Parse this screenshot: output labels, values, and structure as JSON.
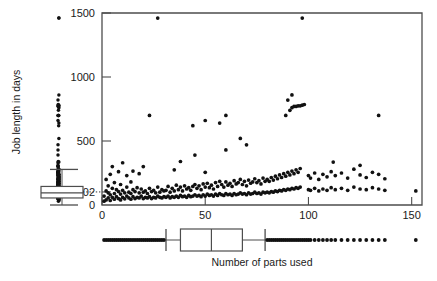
{
  "figure": {
    "background": "#ffffff",
    "point_color": "#111111",
    "line_color": "#4d4d4d",
    "box_fill": "#ffffff",
    "width": 437,
    "height": 281
  },
  "axes": {
    "y": {
      "title": "Job length in days",
      "ticks": [
        0,
        102,
        500,
        1000,
        1500
      ],
      "tick_labels": [
        "0",
        "102",
        "500",
        "1000",
        "1500"
      ],
      "range": [
        0,
        1500
      ],
      "orientation": "vertical-rotated-label"
    },
    "x": {
      "title": "Number of parts used",
      "ticks": [
        0,
        50,
        100,
        150
      ],
      "tick_labels": [
        "0",
        "50",
        "100",
        "150"
      ],
      "range": [
        0,
        155
      ]
    },
    "frame": {
      "left": 102,
      "right": 422,
      "top": 13,
      "bottom": 205
    }
  },
  "marginal": {
    "y_boxplot": {
      "orientation": "vertical",
      "min_whisker": 0,
      "lower_quartile": 55,
      "median": 95,
      "upper_quartile": 145,
      "upper_whisker": 278,
      "outliers": [
        305,
        330,
        355,
        380,
        410,
        440,
        470,
        500,
        540,
        580,
        620,
        650,
        680,
        700,
        715,
        730,
        745,
        760,
        775,
        790,
        805,
        860,
        1460
      ],
      "strip_note": "one-dimensional strip of all y values drawn left of the boxplot"
    },
    "x_boxplot": {
      "orientation": "horizontal",
      "lower_whisker": 31,
      "lower_quartile": 38,
      "median": 53,
      "upper_quartile": 68,
      "upper_whisker": 79,
      "low_outliers": [
        1,
        2,
        3,
        4,
        5,
        6,
        7,
        8,
        9,
        10,
        11,
        12,
        13,
        14,
        15,
        16,
        17,
        18,
        19,
        20,
        21,
        22,
        23,
        24,
        25,
        26,
        27,
        28,
        29,
        30
      ],
      "high_outliers": [
        80,
        81,
        82,
        83,
        84,
        85,
        86,
        87,
        88,
        89,
        90,
        91,
        92,
        93,
        94,
        95,
        96,
        97,
        98,
        99,
        100,
        101,
        103,
        105,
        107,
        109,
        111,
        113,
        116,
        119,
        122,
        125,
        128,
        131,
        134,
        137,
        152
      ]
    }
  },
  "chart_data": {
    "type": "scatter",
    "title": "",
    "xlabel": "Number of parts used",
    "ylabel": "Job length in days",
    "xlim": [
      0,
      155
    ],
    "ylim": [
      0,
      1500
    ],
    "grid": false,
    "legend": "none",
    "annotations": [
      {
        "text": "102",
        "kind": "y-axis reference tick linked by dotted line to the marginal boxplot median"
      }
    ],
    "marginal_boxplots": [
      "left (y variable)",
      "bottom (x variable)"
    ],
    "points": [
      [
        1,
        30
      ],
      [
        1,
        70
      ],
      [
        2,
        40
      ],
      [
        2,
        110
      ],
      [
        2,
        200
      ],
      [
        3,
        55
      ],
      [
        3,
        95
      ],
      [
        3,
        150
      ],
      [
        4,
        35
      ],
      [
        4,
        80
      ],
      [
        4,
        240
      ],
      [
        5,
        60
      ],
      [
        5,
        130
      ],
      [
        5,
        300
      ],
      [
        6,
        45
      ],
      [
        6,
        90
      ],
      [
        6,
        175
      ],
      [
        7,
        65
      ],
      [
        7,
        120
      ],
      [
        8,
        50
      ],
      [
        8,
        105
      ],
      [
        8,
        260
      ],
      [
        9,
        40
      ],
      [
        9,
        85
      ],
      [
        9,
        160
      ],
      [
        10,
        60
      ],
      [
        10,
        115
      ],
      [
        10,
        330
      ],
      [
        11,
        48
      ],
      [
        11,
        95
      ],
      [
        12,
        70
      ],
      [
        12,
        140
      ],
      [
        12,
        230
      ],
      [
        13,
        55
      ],
      [
        13,
        100
      ],
      [
        14,
        45
      ],
      [
        14,
        90
      ],
      [
        14,
        180
      ],
      [
        15,
        65
      ],
      [
        15,
        120
      ],
      [
        15,
        265
      ],
      [
        16,
        50
      ],
      [
        16,
        105
      ],
      [
        17,
        60
      ],
      [
        17,
        135
      ],
      [
        18,
        55
      ],
      [
        18,
        95
      ],
      [
        18,
        245
      ],
      [
        19,
        70
      ],
      [
        19,
        125
      ],
      [
        20,
        50
      ],
      [
        20,
        100
      ],
      [
        20,
        300
      ],
      [
        21,
        60
      ],
      [
        21,
        110
      ],
      [
        22,
        55
      ],
      [
        22,
        90
      ],
      [
        23,
        65
      ],
      [
        23,
        130
      ],
      [
        24,
        50
      ],
      [
        24,
        105
      ],
      [
        25,
        60
      ],
      [
        25,
        115
      ],
      [
        26,
        55
      ],
      [
        26,
        95
      ],
      [
        27,
        70
      ],
      [
        27,
        140
      ],
      [
        28,
        60
      ],
      [
        28,
        100
      ],
      [
        29,
        55
      ],
      [
        29,
        120
      ],
      [
        30,
        65
      ],
      [
        30,
        110
      ],
      [
        23,
        700
      ],
      [
        27,
        1460
      ],
      [
        31,
        60
      ],
      [
        31,
        115
      ],
      [
        32,
        70
      ],
      [
        32,
        145
      ],
      [
        33,
        55
      ],
      [
        33,
        100
      ],
      [
        34,
        65
      ],
      [
        34,
        130
      ],
      [
        35,
        60
      ],
      [
        35,
        110
      ],
      [
        35,
        275
      ],
      [
        36,
        70
      ],
      [
        36,
        155
      ],
      [
        37,
        60
      ],
      [
        37,
        120
      ],
      [
        38,
        75
      ],
      [
        38,
        140
      ],
      [
        38,
        340
      ],
      [
        39,
        65
      ],
      [
        39,
        110
      ],
      [
        40,
        70
      ],
      [
        40,
        150
      ],
      [
        41,
        60
      ],
      [
        41,
        125
      ],
      [
        42,
        75
      ],
      [
        42,
        135
      ],
      [
        43,
        65
      ],
      [
        43,
        115
      ],
      [
        44,
        70
      ],
      [
        44,
        145
      ],
      [
        45,
        80
      ],
      [
        45,
        160
      ],
      [
        45,
        390
      ],
      [
        46,
        70
      ],
      [
        46,
        130
      ],
      [
        47,
        75
      ],
      [
        47,
        150
      ],
      [
        48,
        65
      ],
      [
        48,
        120
      ],
      [
        49,
        80
      ],
      [
        49,
        165
      ],
      [
        50,
        70
      ],
      [
        50,
        140
      ],
      [
        50,
        255
      ],
      [
        51,
        85
      ],
      [
        51,
        170
      ],
      [
        52,
        75
      ],
      [
        52,
        135
      ],
      [
        53,
        80
      ],
      [
        53,
        155
      ],
      [
        54,
        70
      ],
      [
        54,
        125
      ],
      [
        55,
        85
      ],
      [
        55,
        175
      ],
      [
        56,
        75
      ],
      [
        56,
        145
      ],
      [
        57,
        90
      ],
      [
        57,
        185
      ],
      [
        58,
        80
      ],
      [
        58,
        160
      ],
      [
        59,
        75
      ],
      [
        59,
        140
      ],
      [
        60,
        90
      ],
      [
        60,
        180
      ],
      [
        60,
        430
      ],
      [
        61,
        80
      ],
      [
        61,
        155
      ],
      [
        62,
        85
      ],
      [
        62,
        170
      ],
      [
        63,
        75
      ],
      [
        63,
        145
      ],
      [
        64,
        90
      ],
      [
        64,
        190
      ],
      [
        65,
        80
      ],
      [
        65,
        165
      ],
      [
        66,
        85
      ],
      [
        66,
        175
      ],
      [
        67,
        95
      ],
      [
        67,
        200
      ],
      [
        68,
        85
      ],
      [
        68,
        160
      ],
      [
        69,
        90
      ],
      [
        69,
        185
      ],
      [
        70,
        80
      ],
      [
        70,
        150
      ],
      [
        71,
        95
      ],
      [
        71,
        195
      ],
      [
        72,
        85
      ],
      [
        72,
        170
      ],
      [
        73,
        90
      ],
      [
        73,
        180
      ],
      [
        74,
        100
      ],
      [
        74,
        205
      ],
      [
        75,
        90
      ],
      [
        75,
        175
      ],
      [
        76,
        95
      ],
      [
        76,
        190
      ],
      [
        77,
        85
      ],
      [
        77,
        165
      ],
      [
        78,
        100
      ],
      [
        78,
        210
      ],
      [
        79,
        95
      ],
      [
        79,
        185
      ],
      [
        44,
        620
      ],
      [
        50,
        660
      ],
      [
        57,
        640
      ],
      [
        60,
        700
      ],
      [
        67,
        520
      ],
      [
        70,
        470
      ],
      [
        80,
        100
      ],
      [
        80,
        200
      ],
      [
        81,
        95
      ],
      [
        81,
        185
      ],
      [
        82,
        105
      ],
      [
        82,
        215
      ],
      [
        83,
        100
      ],
      [
        83,
        195
      ],
      [
        84,
        110
      ],
      [
        84,
        225
      ],
      [
        85,
        105
      ],
      [
        85,
        205
      ],
      [
        86,
        115
      ],
      [
        86,
        235
      ],
      [
        87,
        110
      ],
      [
        87,
        215
      ],
      [
        88,
        120
      ],
      [
        88,
        245
      ],
      [
        89,
        115
      ],
      [
        89,
        225
      ],
      [
        90,
        125
      ],
      [
        90,
        255
      ],
      [
        91,
        120
      ],
      [
        91,
        235
      ],
      [
        92,
        130
      ],
      [
        92,
        265
      ],
      [
        93,
        125
      ],
      [
        93,
        245
      ],
      [
        94,
        135
      ],
      [
        94,
        275
      ],
      [
        95,
        130
      ],
      [
        95,
        255
      ],
      [
        96,
        140
      ],
      [
        96,
        285
      ],
      [
        91,
        740
      ],
      [
        92,
        760
      ],
      [
        93,
        770
      ],
      [
        94,
        770
      ],
      [
        95,
        775
      ],
      [
        96,
        775
      ],
      [
        97,
        780
      ],
      [
        98,
        785
      ],
      [
        90,
        820
      ],
      [
        92,
        860
      ],
      [
        89,
        700
      ],
      [
        97,
        1460
      ],
      [
        100,
        120
      ],
      [
        100,
        230
      ],
      [
        101,
        115
      ],
      [
        101,
        210
      ],
      [
        103,
        130
      ],
      [
        103,
        250
      ],
      [
        105,
        110
      ],
      [
        105,
        200
      ],
      [
        107,
        125
      ],
      [
        107,
        240
      ],
      [
        109,
        115
      ],
      [
        109,
        220
      ],
      [
        111,
        135
      ],
      [
        111,
        260
      ],
      [
        113,
        120
      ],
      [
        113,
        230
      ],
      [
        116,
        130
      ],
      [
        116,
        250
      ],
      [
        119,
        115
      ],
      [
        119,
        210
      ],
      [
        122,
        140
      ],
      [
        122,
        280
      ],
      [
        125,
        125
      ],
      [
        125,
        235
      ],
      [
        128,
        120
      ],
      [
        128,
        215
      ],
      [
        131,
        135
      ],
      [
        131,
        255
      ],
      [
        134,
        125
      ],
      [
        134,
        240
      ],
      [
        137,
        115
      ],
      [
        137,
        205
      ],
      [
        112,
        335
      ],
      [
        125,
        310
      ],
      [
        134,
        700
      ],
      [
        152,
        110
      ]
    ]
  }
}
